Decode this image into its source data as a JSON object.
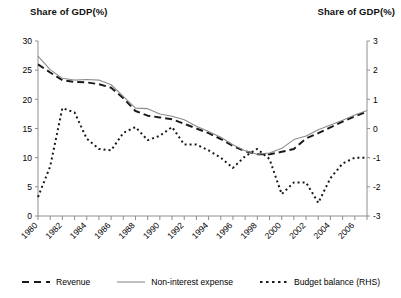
{
  "chart_data": {
    "type": "line",
    "title": "",
    "left_axis_title": "Share of GDP(%)",
    "right_axis_title": "Share of GDP(%)",
    "xlabel": "",
    "ylabel": "Share of GDP(%)",
    "y2label": "Share of GDP(%)",
    "ylim": [
      0,
      30
    ],
    "y2lim": [
      -3,
      3
    ],
    "yticks": [
      0,
      5,
      10,
      15,
      20,
      25,
      30
    ],
    "y2ticks": [
      -3,
      -2,
      -1,
      0,
      1,
      2,
      3
    ],
    "grid": false,
    "legend_position": "bottom",
    "x": [
      1980,
      1981,
      1982,
      1983,
      1984,
      1985,
      1986,
      1987,
      1988,
      1989,
      1990,
      1991,
      1992,
      1993,
      1994,
      1995,
      1996,
      1997,
      1998,
      1999,
      2000,
      2001,
      2002,
      2003,
      2004,
      2005,
      2006,
      2007
    ],
    "xtick_labels": [
      "1980",
      "1982",
      "1984",
      "1986",
      "1988",
      "1990",
      "1992",
      "1994",
      "1996",
      "1998",
      "2000",
      "2002",
      "2004",
      "2006"
    ],
    "xtick_values": [
      1980,
      1982,
      1984,
      1986,
      1988,
      1990,
      1992,
      1994,
      1996,
      1998,
      2000,
      2002,
      2004,
      2006
    ],
    "series": [
      {
        "name": "Revenue",
        "axis": "left",
        "style": "dashed",
        "color": "#1a1a1a",
        "values": [
          26.0,
          24.6,
          23.3,
          23.0,
          22.9,
          22.6,
          22.0,
          20.2,
          18.0,
          17.2,
          16.9,
          16.6,
          15.8,
          15.0,
          14.2,
          13.2,
          12.0,
          11.1,
          10.6,
          10.6,
          11.0,
          11.5,
          13.3,
          14.2,
          15.2,
          16.2,
          17.1,
          17.9
        ]
      },
      {
        "name": "Non-interest expense",
        "axis": "left",
        "style": "solid",
        "color": "#8c8c8c",
        "values": [
          27.4,
          25.1,
          23.6,
          23.3,
          23.4,
          23.3,
          22.5,
          20.5,
          18.5,
          18.4,
          17.5,
          17.1,
          16.5,
          15.4,
          14.5,
          13.5,
          12.2,
          11.2,
          10.6,
          10.8,
          11.6,
          13.1,
          13.7,
          14.8,
          15.6,
          16.4,
          17.3,
          18.1
        ]
      },
      {
        "name": "Budget balance (RHS)",
        "axis": "right",
        "style": "dotted",
        "color": "#1a1a1a",
        "values": [
          -2.35,
          -1.3,
          0.7,
          0.55,
          -0.35,
          -0.7,
          -0.75,
          -0.15,
          0.05,
          -0.4,
          -0.25,
          0.05,
          -0.55,
          -0.55,
          -0.75,
          -1.0,
          -1.35,
          -0.95,
          -0.7,
          -1.05,
          -2.25,
          -1.85,
          -1.85,
          -2.55,
          -1.7,
          -1.2,
          -1.0,
          -1.0
        ]
      }
    ]
  },
  "legend": [
    {
      "label": "Revenue",
      "style": "dashed",
      "color": "#1a1a1a"
    },
    {
      "label": "Non-interest expense",
      "style": "solid",
      "color": "#8c8c8c"
    },
    {
      "label": "Budget balance (RHS)",
      "style": "dotted",
      "color": "#1a1a1a"
    }
  ],
  "axes": {
    "left_title": "Share of GDP(%)",
    "right_title": "Share of GDP(%)"
  }
}
